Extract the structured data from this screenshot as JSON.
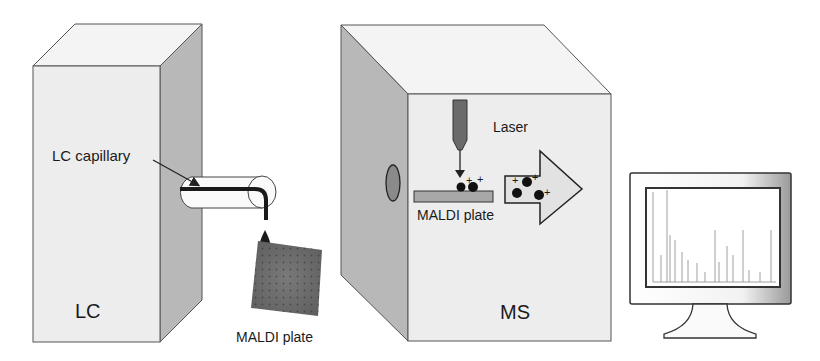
{
  "labels": {
    "lc_capillary": "LC capillary",
    "lc": "LC",
    "maldi_plate_outside": "MALDI plate",
    "laser": "Laser",
    "maldi_plate_inside": "MALDI plate",
    "ms": "MS"
  },
  "colors": {
    "box_front": "#ededed",
    "box_top": "#f4f4f4",
    "box_side": "#b8b8b8",
    "outline": "#555555",
    "plate_dark": "#6e6e6e",
    "laser": "#6a6a6a",
    "arrow_fill": "#e2e2e2"
  },
  "components": [
    {
      "id": "lc-instrument",
      "label": "LC"
    },
    {
      "id": "ms-instrument",
      "label": "MS"
    },
    {
      "id": "computer-monitor",
      "label": "mass spectrum display"
    }
  ]
}
